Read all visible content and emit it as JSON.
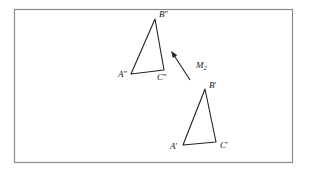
{
  "figure": {
    "background_color": "#ffffff",
    "stroke_color": "#222222",
    "frame": {
      "name": "figure-border",
      "x": 14,
      "y": 9,
      "width": 279,
      "height": 154,
      "color": "#8a8a8a"
    },
    "triangles": [
      {
        "id": "triangle-double-prime",
        "vertices": [
          {
            "label": "A″",
            "base": "A",
            "prime": "″",
            "x": 131,
            "y": 74,
            "label_x": 118,
            "label_y": 77
          },
          {
            "label": "B″",
            "base": "B",
            "prime": "″",
            "x": 155,
            "y": 19,
            "label_x": 159,
            "label_y": 17
          },
          {
            "label": "C″",
            "base": "C",
            "prime": "″",
            "x": 164,
            "y": 70,
            "label_x": 157,
            "label_y": 80
          }
        ]
      },
      {
        "id": "triangle-single-prime",
        "vertices": [
          {
            "label": "A′",
            "base": "A",
            "prime": "′",
            "x": 183,
            "y": 145,
            "label_x": 170,
            "label_y": 149
          },
          {
            "label": "B′",
            "base": "B",
            "prime": "′",
            "x": 205,
            "y": 89,
            "label_x": 209,
            "label_y": 88
          },
          {
            "label": "C′",
            "base": "C",
            "prime": "′",
            "x": 216,
            "y": 142,
            "label_x": 220,
            "label_y": 148
          }
        ]
      }
    ],
    "mapping_arrow": {
      "id": "mapping-arrow-m2",
      "label_base": "M",
      "label_subscript": "2",
      "label_full": "M₂",
      "label_x": 196,
      "label_y": 68,
      "tail_x": 190,
      "tail_y": 80,
      "tip_x": 172,
      "tip_y": 52
    }
  }
}
